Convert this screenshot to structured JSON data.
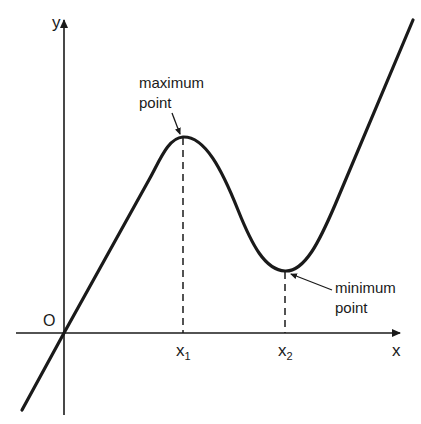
{
  "diagram": {
    "type": "function-graph",
    "axes": {
      "x_label": "x",
      "y_label": "y",
      "origin_label": "O"
    },
    "ticks": [
      {
        "label": "x",
        "sub": "1"
      },
      {
        "label": "x",
        "sub": "2"
      }
    ],
    "annotations": {
      "maximum": {
        "line1": "maximum",
        "line2": "point"
      },
      "minimum": {
        "line1": "minimum",
        "line2": "point"
      }
    },
    "colors": {
      "ink": "#1a1a1a",
      "background": "#ffffff"
    }
  }
}
